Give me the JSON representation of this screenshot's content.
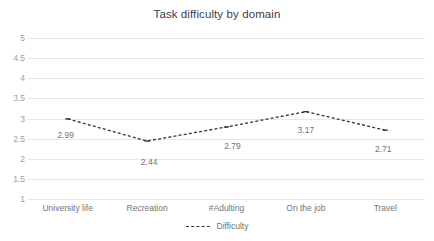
{
  "chart_data": {
    "type": "line",
    "title": "Task difficulty by domain",
    "xlabel": "",
    "ylabel": "",
    "categories": [
      "University life",
      "Recreation",
      "#Adulting",
      "On the job",
      "Travel"
    ],
    "series": [
      {
        "name": "Difficulty",
        "values": [
          2.99,
          2.44,
          2.79,
          3.17,
          2.71
        ],
        "labels": [
          "2.99",
          "2.44",
          "2.79",
          "3.17",
          "2.71"
        ],
        "line_style": "dashed",
        "color": "#333333"
      }
    ],
    "ylim": [
      1,
      5
    ],
    "ytick_values": [
      5,
      4.5,
      4,
      3.5,
      3,
      2.5,
      2,
      1.5,
      1
    ],
    "ytick_labels": [
      "5",
      "4.5",
      "4",
      "3.5",
      "3",
      "2.5",
      "2",
      "1.5",
      "1"
    ],
    "grid": true,
    "grid_color": "#e6e6e6",
    "legend_position": "bottom",
    "legend_entries": [
      "Difficulty"
    ],
    "background": "#ffffff"
  }
}
